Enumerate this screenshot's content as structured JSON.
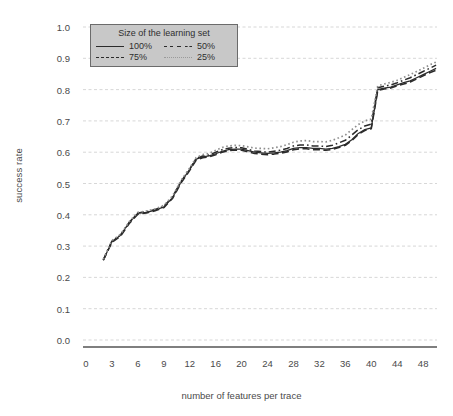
{
  "chart_data": {
    "type": "line",
    "title": "",
    "xlabel": "number of features per trace",
    "ylabel": "success rate",
    "xlim": [
      0,
      51
    ],
    "ylim": [
      0.0,
      1.0
    ],
    "grid": true,
    "legend_position": "top-left",
    "legend_title": "Size of the learning set",
    "y_ticks": [
      "1.0",
      "0.9",
      "0.8",
      "0.7",
      "0.6",
      "0.5",
      "0.4",
      "0.3",
      "0.2",
      "0.1",
      "0.0"
    ],
    "y_tick_values": [
      1.0,
      0.9,
      0.8,
      0.7,
      0.6,
      0.5,
      0.4,
      0.3,
      0.2,
      0.1,
      0.0
    ],
    "x_ticks": [
      "0",
      "3",
      "6",
      "9",
      "12",
      "16",
      "20",
      "24",
      "28",
      "32",
      "36",
      "40",
      "44",
      "48"
    ],
    "x_tick_values": [
      0,
      3,
      6,
      9,
      12,
      16,
      20,
      24,
      28,
      32,
      36,
      40,
      44,
      48
    ],
    "x": [
      2,
      3,
      4,
      5,
      6,
      7,
      8,
      9,
      10,
      11,
      12,
      13,
      14,
      15,
      16,
      17,
      18,
      19,
      20,
      21,
      22,
      23,
      24,
      25,
      26,
      27,
      28,
      29,
      30,
      31,
      32,
      33,
      34,
      35,
      36,
      37,
      38,
      39,
      40,
      41,
      42,
      43,
      44,
      45,
      46,
      47,
      48,
      49,
      50
    ],
    "series": [
      {
        "name": "100%",
        "style": "solid",
        "color": "#2b2b2b",
        "values": [
          0.255,
          0.315,
          0.335,
          0.375,
          0.405,
          0.408,
          0.415,
          0.425,
          0.455,
          0.505,
          0.545,
          0.578,
          0.585,
          0.588,
          0.595,
          0.603,
          0.608,
          0.61,
          0.61,
          0.605,
          0.6,
          0.598,
          0.596,
          0.598,
          0.6,
          0.605,
          0.612,
          0.615,
          0.615,
          0.612,
          0.612,
          0.61,
          0.612,
          0.618,
          0.625,
          0.64,
          0.66,
          0.672,
          0.678,
          0.8,
          0.805,
          0.808,
          0.815,
          0.822,
          0.828,
          0.838,
          0.848,
          0.858,
          0.868
        ]
      },
      {
        "name": "75%",
        "style": "dashed",
        "color": "#2b2b2b",
        "values": [
          0.255,
          0.312,
          0.332,
          0.372,
          0.402,
          0.406,
          0.413,
          0.423,
          0.452,
          0.502,
          0.542,
          0.575,
          0.582,
          0.585,
          0.592,
          0.6,
          0.605,
          0.607,
          0.606,
          0.601,
          0.596,
          0.594,
          0.592,
          0.594,
          0.597,
          0.601,
          0.608,
          0.611,
          0.611,
          0.608,
          0.608,
          0.606,
          0.609,
          0.615,
          0.622,
          0.637,
          0.657,
          0.669,
          0.675,
          0.797,
          0.802,
          0.805,
          0.812,
          0.818,
          0.824,
          0.834,
          0.844,
          0.854,
          0.862
        ]
      },
      {
        "name": "50%",
        "style": "dashdot",
        "color": "#2b2b2b",
        "values": [
          0.256,
          0.316,
          0.336,
          0.376,
          0.406,
          0.41,
          0.417,
          0.427,
          0.457,
          0.507,
          0.547,
          0.58,
          0.588,
          0.591,
          0.6,
          0.608,
          0.613,
          0.615,
          0.614,
          0.609,
          0.604,
          0.602,
          0.6,
          0.603,
          0.606,
          0.612,
          0.62,
          0.623,
          0.623,
          0.62,
          0.62,
          0.618,
          0.622,
          0.63,
          0.638,
          0.655,
          0.672,
          0.684,
          0.69,
          0.806,
          0.811,
          0.815,
          0.822,
          0.83,
          0.838,
          0.848,
          0.858,
          0.868,
          0.878
        ]
      },
      {
        "name": "25%",
        "style": "dotted",
        "color": "#8f8f8f",
        "values": [
          0.258,
          0.318,
          0.338,
          0.378,
          0.408,
          0.412,
          0.419,
          0.43,
          0.46,
          0.51,
          0.55,
          0.583,
          0.592,
          0.596,
          0.606,
          0.615,
          0.62,
          0.622,
          0.621,
          0.617,
          0.613,
          0.612,
          0.611,
          0.614,
          0.618,
          0.624,
          0.632,
          0.636,
          0.637,
          0.634,
          0.634,
          0.633,
          0.638,
          0.646,
          0.655,
          0.672,
          0.688,
          0.7,
          0.706,
          0.812,
          0.818,
          0.823,
          0.83,
          0.839,
          0.848,
          0.858,
          0.868,
          0.879,
          0.888
        ]
      }
    ]
  },
  "legend": {
    "title": "Size of the learning set",
    "entries": [
      {
        "label": "100%",
        "style": "solid"
      },
      {
        "label": "50%",
        "style": "dashdot"
      },
      {
        "label": "75%",
        "style": "dashed"
      },
      {
        "label": "25%",
        "style": "dotted"
      }
    ]
  },
  "axes": {
    "y_title": "success rate",
    "x_title": "number of features per trace"
  }
}
